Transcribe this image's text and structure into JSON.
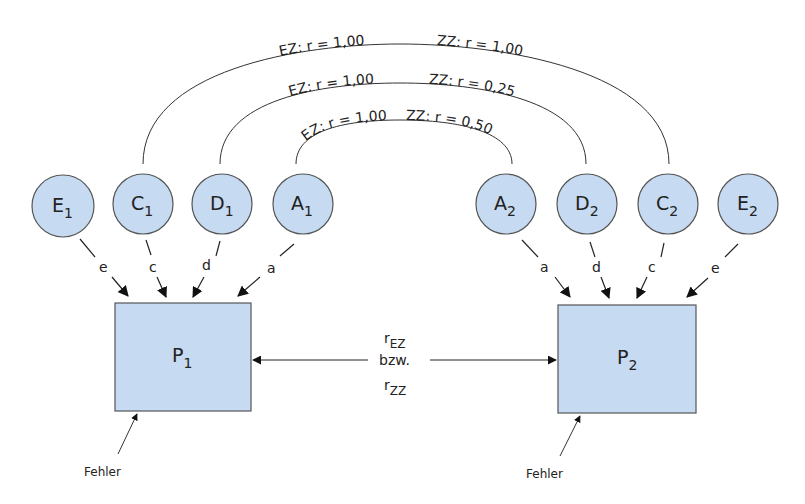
{
  "colors": {
    "node_fill": "#c6daf1",
    "node_stroke": "#555555",
    "line": "#333333",
    "text": "#222222"
  },
  "arcs": [
    {
      "from": "C1",
      "to": "C2",
      "ez_label": "EZ: r = 1,00",
      "zz_label": "ZZ: r = 1,00"
    },
    {
      "from": "D1",
      "to": "D2",
      "ez_label": "EZ: r = 1,00",
      "zz_label": "ZZ: r = 0,25"
    },
    {
      "from": "A1",
      "to": "A2",
      "ez_label": "EZ: r = 1,00",
      "zz_label": "ZZ: r = 0,50"
    }
  ],
  "twin1": {
    "nodes": [
      {
        "letter": "E",
        "sub": "1",
        "path": "e"
      },
      {
        "letter": "C",
        "sub": "1",
        "path": "c"
      },
      {
        "letter": "D",
        "sub": "1",
        "path": "d"
      },
      {
        "letter": "A",
        "sub": "1",
        "path": "a"
      }
    ],
    "phenotype": {
      "letter": "P",
      "sub": "1"
    },
    "error_label": "Fehler"
  },
  "twin2": {
    "nodes": [
      {
        "letter": "A",
        "sub": "2",
        "path": "a"
      },
      {
        "letter": "D",
        "sub": "2",
        "path": "d"
      },
      {
        "letter": "C",
        "sub": "2",
        "path": "c"
      },
      {
        "letter": "E",
        "sub": "2",
        "path": "e"
      }
    ],
    "phenotype": {
      "letter": "P",
      "sub": "2"
    },
    "error_label": "Fehler"
  },
  "correlation": {
    "r1_base": "r",
    "r1_sub": "EZ",
    "connector": "bzw.",
    "r2_base": "r",
    "r2_sub": "ZZ"
  }
}
